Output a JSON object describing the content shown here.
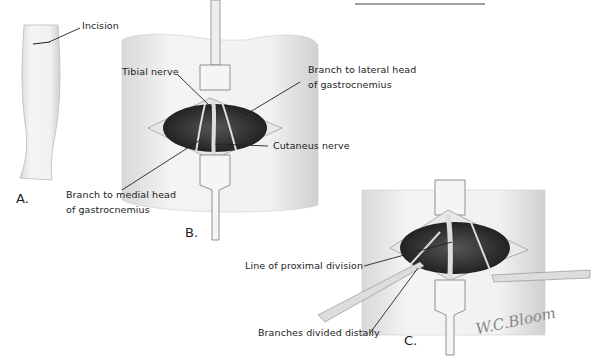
{
  "figure": {
    "top_rule": true,
    "panels": [
      {
        "id": "A",
        "label": "A.",
        "labels": [
          {
            "text": "Incision"
          }
        ]
      },
      {
        "id": "B",
        "label": "B.",
        "labels": [
          {
            "text": "Tibial nerve"
          },
          {
            "text": "Branch to lateral head"
          },
          {
            "text": "of gastrocnemius"
          },
          {
            "text": "Cutaneus nerve"
          },
          {
            "text": "Branch to medial head"
          },
          {
            "text": "of gastrocnemius"
          }
        ]
      },
      {
        "id": "C",
        "label": "C.",
        "labels": [
          {
            "text": "Line of proximal division"
          },
          {
            "text": "Branches divided distally"
          }
        ]
      }
    ],
    "signature": "W.C.Bloom"
  }
}
